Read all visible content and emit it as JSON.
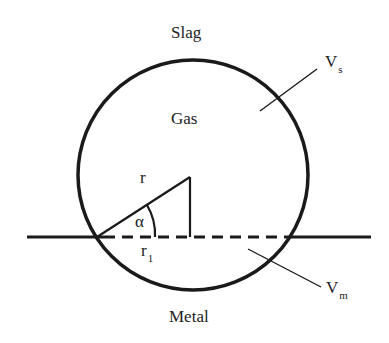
{
  "diagram": {
    "regions": {
      "slag": "Slag",
      "gas": "Gas",
      "metal": "Metal"
    },
    "labels": {
      "radius": "r",
      "angle": "α",
      "contact_radius_base": "r",
      "contact_radius_sub": "1",
      "volume_slag_base": "V",
      "volume_slag_sub": "s",
      "volume_metal_base": "V",
      "volume_metal_sub": "m"
    },
    "colors": {
      "stroke": "#1a1a1a",
      "text": "#222222",
      "background": "#ffffff"
    }
  }
}
